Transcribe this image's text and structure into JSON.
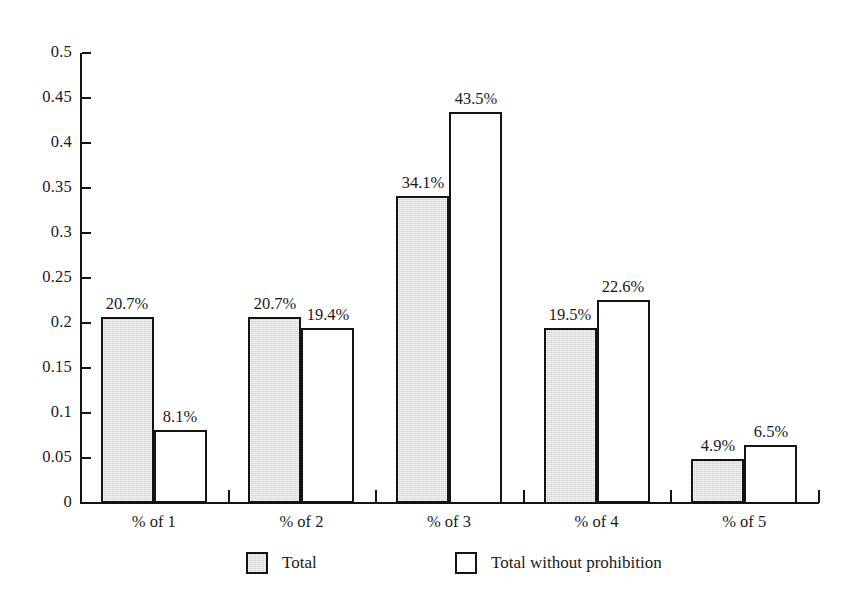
{
  "chart_data": {
    "type": "bar",
    "title": "",
    "subtitle": "",
    "xlabel": "",
    "ylabel": "",
    "categories": [
      "% of 1",
      "% of 2",
      "% of 3",
      "% of 4",
      "% of 5"
    ],
    "series": [
      {
        "name": "Total",
        "color": "#d2d2d2",
        "values": [
          0.207,
          0.207,
          0.341,
          0.195,
          0.049
        ],
        "data_labels": [
          "20.7%",
          "20.7%",
          "34.1%",
          "19.5%",
          "4.9%"
        ]
      },
      {
        "name": "Total without prohibition",
        "color": "#ffffff",
        "values": [
          0.081,
          0.194,
          0.435,
          0.226,
          0.065
        ],
        "data_labels": [
          "8.1%",
          "19.4%",
          "43.5%",
          "22.6%",
          "6.5%"
        ]
      }
    ],
    "ylim": [
      0,
      0.5
    ],
    "ytick_values": [
      0,
      0.05,
      0.1,
      0.15,
      0.2,
      0.25,
      0.3,
      0.35,
      0.4,
      0.45,
      0.5
    ],
    "ytick_labels": [
      "0",
      "0.05",
      "0.1",
      "0.15",
      "0.2",
      "0.25",
      "0.3",
      "0.35",
      "0.4",
      "0.45",
      "0.5"
    ],
    "grid": false,
    "legend_position": "bottom",
    "bar_border_color": "#141414",
    "axis_color": "#141414",
    "background": "#ffffff"
  },
  "legend": {
    "entries": [
      {
        "label": "Total",
        "swatch": "filled-gray"
      },
      {
        "label": "Total without prohibition",
        "swatch": "outline-white"
      }
    ]
  }
}
